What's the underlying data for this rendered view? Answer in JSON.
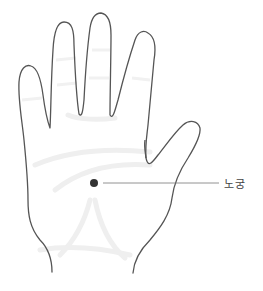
{
  "figure": {
    "point": {
      "label": "노궁",
      "x": 94,
      "y": 183
    },
    "colors": {
      "outline": "#555555",
      "shading": "#eeeeee",
      "dot": "#333333",
      "leader_line": "#777777",
      "label_text": "#444444"
    }
  }
}
